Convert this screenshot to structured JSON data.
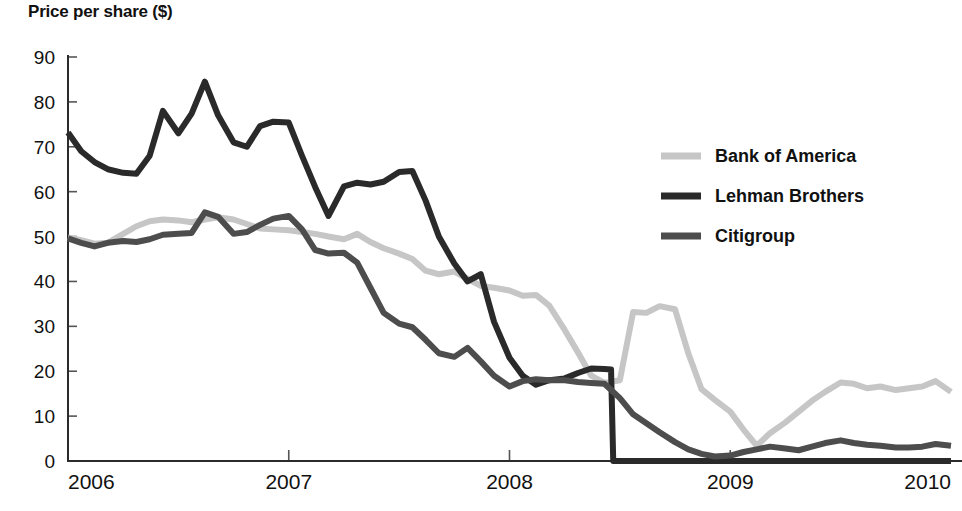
{
  "chart_data": {
    "type": "line",
    "title": "Price per share ($)",
    "xlabel": "",
    "ylabel": "Price per share ($)",
    "xlim": [
      2006,
      2010
    ],
    "ylim": [
      0,
      90
    ],
    "y_ticks": [
      0,
      10,
      20,
      30,
      40,
      50,
      60,
      70,
      80,
      90
    ],
    "y_tick_labels": [
      "0",
      "10",
      "20",
      "30",
      "40",
      "50",
      "60",
      "70",
      "80",
      "90"
    ],
    "x_ticks": [
      2006,
      2007,
      2008,
      2009,
      2010
    ],
    "x_tick_labels": [
      "2006",
      "2007",
      "2008",
      "2009",
      "2010"
    ],
    "grid": false,
    "legend_position": "right-upper",
    "series": [
      {
        "name": "Bank of America",
        "color": "#c6c6c6",
        "stroke_width": 6,
        "x": [
          2006.0,
          2006.06,
          2006.12,
          2006.18,
          2006.25,
          2006.31,
          2006.37,
          2006.43,
          2006.5,
          2006.56,
          2006.62,
          2006.68,
          2006.75,
          2006.81,
          2006.87,
          2006.93,
          2007.0,
          2007.06,
          2007.12,
          2007.18,
          2007.25,
          2007.31,
          2007.37,
          2007.43,
          2007.5,
          2007.56,
          2007.62,
          2007.68,
          2007.75,
          2007.81,
          2007.87,
          2007.93,
          2008.0,
          2008.06,
          2008.12,
          2008.18,
          2008.25,
          2008.31,
          2008.37,
          2008.43,
          2008.5,
          2008.56,
          2008.62,
          2008.68,
          2008.75,
          2008.81,
          2008.87,
          2008.93,
          2009.0,
          2009.06,
          2009.12,
          2009.18,
          2009.25,
          2009.31,
          2009.37,
          2009.43,
          2009.5,
          2009.56,
          2009.62,
          2009.68,
          2009.75,
          2009.81,
          2009.87,
          2009.93,
          2010.0
        ],
        "y": [
          49.8,
          49.2,
          48.4,
          48.6,
          50.6,
          52.3,
          53.4,
          53.8,
          53.6,
          53.2,
          53.8,
          54.3,
          53.8,
          52.8,
          51.8,
          51.6,
          51.4,
          51.0,
          50.6,
          50.0,
          49.4,
          50.6,
          48.8,
          47.4,
          46.2,
          45.0,
          42.4,
          41.6,
          42.2,
          40.6,
          39.0,
          38.6,
          38.0,
          36.8,
          37.0,
          34.6,
          29.2,
          24.2,
          19.0,
          17.4,
          18.0,
          33.2,
          33.0,
          34.5,
          33.8,
          24.0,
          16.0,
          13.6,
          11.0,
          7.0,
          3.4,
          6.2,
          8.6,
          11.0,
          13.4,
          15.4,
          17.5,
          17.2,
          16.2,
          16.6,
          15.8,
          16.2,
          16.6,
          17.8,
          15.4
        ]
      },
      {
        "name": "Lehman Brothers",
        "color": "#2a2a2a",
        "stroke_width": 6,
        "x": [
          2006.0,
          2006.06,
          2006.12,
          2006.18,
          2006.25,
          2006.31,
          2006.37,
          2006.43,
          2006.5,
          2006.56,
          2006.62,
          2006.68,
          2006.75,
          2006.81,
          2006.87,
          2006.93,
          2007.0,
          2007.06,
          2007.12,
          2007.18,
          2007.25,
          2007.31,
          2007.37,
          2007.43,
          2007.5,
          2007.56,
          2007.62,
          2007.68,
          2007.75,
          2007.81,
          2007.87,
          2007.93,
          2008.0,
          2008.06,
          2008.12,
          2008.18,
          2008.25,
          2008.31,
          2008.37,
          2008.43,
          2008.46,
          2008.47,
          2008.5,
          2008.56,
          2008.62,
          2008.68,
          2008.75,
          2008.81,
          2008.87,
          2008.93,
          2009.0,
          2009.25,
          2009.5,
          2009.75,
          2010.0
        ],
        "y": [
          73.2,
          69.0,
          66.6,
          65.0,
          64.2,
          64.0,
          68.0,
          78.0,
          73.0,
          77.4,
          84.5,
          77.0,
          71.0,
          70.0,
          74.6,
          75.6,
          75.4,
          68.0,
          61.0,
          54.6,
          61.2,
          62.0,
          61.6,
          62.2,
          64.4,
          64.6,
          58.0,
          50.0,
          44.0,
          40.0,
          41.6,
          31.0,
          23.0,
          19.0,
          17.0,
          18.0,
          18.4,
          19.6,
          20.6,
          20.5,
          20.4,
          0.0,
          0.0,
          0.0,
          0.0,
          0.0,
          0.0,
          0.0,
          0.0,
          0.0,
          0.0,
          0.0,
          0.0,
          0.0,
          0.0
        ]
      },
      {
        "name": "Citigroup",
        "color": "#4d4d4d",
        "stroke_width": 6,
        "x": [
          2006.0,
          2006.06,
          2006.12,
          2006.18,
          2006.25,
          2006.31,
          2006.37,
          2006.43,
          2006.5,
          2006.56,
          2006.62,
          2006.68,
          2006.75,
          2006.81,
          2006.87,
          2006.93,
          2007.0,
          2007.06,
          2007.12,
          2007.18,
          2007.25,
          2007.31,
          2007.37,
          2007.43,
          2007.5,
          2007.56,
          2007.62,
          2007.68,
          2007.75,
          2007.81,
          2007.87,
          2007.93,
          2008.0,
          2008.06,
          2008.12,
          2008.18,
          2008.25,
          2008.31,
          2008.37,
          2008.43,
          2008.5,
          2008.56,
          2008.62,
          2008.68,
          2008.75,
          2008.81,
          2008.87,
          2008.93,
          2009.0,
          2009.06,
          2009.12,
          2009.18,
          2009.25,
          2009.31,
          2009.37,
          2009.43,
          2009.5,
          2009.56,
          2009.62,
          2009.68,
          2009.75,
          2009.81,
          2009.87,
          2009.93,
          2010.0
        ],
        "y": [
          49.6,
          48.6,
          47.8,
          48.6,
          49.0,
          48.8,
          49.4,
          50.4,
          50.6,
          50.8,
          55.4,
          54.4,
          50.6,
          51.0,
          52.6,
          54.0,
          54.6,
          51.6,
          47.0,
          46.2,
          46.4,
          44.2,
          38.6,
          33.0,
          30.6,
          29.8,
          27.0,
          24.0,
          23.2,
          25.2,
          22.2,
          19.0,
          16.6,
          17.8,
          18.2,
          18.0,
          18.0,
          17.6,
          17.4,
          17.2,
          14.0,
          10.4,
          8.4,
          6.4,
          4.2,
          2.6,
          1.6,
          1.0,
          1.2,
          2.0,
          2.6,
          3.2,
          2.8,
          2.4,
          3.2,
          4.0,
          4.6,
          4.0,
          3.6,
          3.4,
          3.0,
          3.0,
          3.2,
          3.8,
          3.4
        ]
      }
    ],
    "legend_entries": [
      {
        "label": "Bank of America",
        "color": "#c6c6c6"
      },
      {
        "label": "Lehman Brothers",
        "color": "#2a2a2a"
      },
      {
        "label": "Citigroup",
        "color": "#4d4d4d"
      }
    ]
  }
}
